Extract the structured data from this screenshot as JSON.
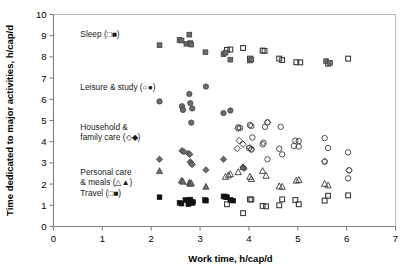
{
  "chart_data": {
    "type": "scatter",
    "title": "",
    "xlabel": "Work time, h/cap/d",
    "ylabel": "Time dedicated to major activities, h/cap/d",
    "xlim": [
      0,
      7
    ],
    "ylim": [
      0,
      10
    ],
    "xticks": [
      0,
      1,
      2,
      3,
      4,
      5,
      6,
      7
    ],
    "yticks": [
      0,
      1,
      2,
      3,
      4,
      5,
      6,
      7,
      8,
      9,
      10
    ],
    "grid": false,
    "legend_position": "inside-left-inline",
    "series": [
      {
        "name": "Sleep",
        "label": "Sleep (□■)",
        "label_x": 0.55,
        "label_y": 8.95,
        "marker_open": "square",
        "marker_filled": "square",
        "points_filled": [
          [
            2.17,
            8.55
          ],
          [
            2.58,
            8.8
          ],
          [
            2.62,
            8.77
          ],
          [
            2.72,
            8.62
          ],
          [
            2.78,
            9.05
          ],
          [
            2.8,
            8.65
          ],
          [
            2.82,
            8.58
          ],
          [
            3.11,
            8.22
          ],
          [
            3.48,
            8.13
          ],
          [
            3.52,
            8.2
          ],
          [
            3.62,
            7.87
          ],
          [
            4.02,
            7.83
          ],
          [
            4.05,
            7.88
          ],
          [
            5.58,
            7.8
          ],
          [
            5.66,
            7.72
          ]
        ],
        "points_open": [
          [
            3.55,
            8.33
          ],
          [
            3.88,
            8.42
          ],
          [
            3.62,
            8.35
          ],
          [
            4.02,
            7.92
          ],
          [
            4.28,
            8.3
          ],
          [
            4.32,
            8.28
          ],
          [
            4.62,
            7.92
          ],
          [
            4.68,
            7.85
          ],
          [
            4.97,
            7.75
          ],
          [
            5.05,
            7.74
          ],
          [
            5.62,
            7.68
          ],
          [
            6.03,
            7.92
          ]
        ]
      },
      {
        "name": "Leisure & study",
        "label": "Leisure & study (○●)",
        "label_x": 0.55,
        "label_y": 6.45,
        "marker_open": "circle",
        "marker_filled": "circle",
        "points_filled": [
          [
            2.17,
            5.9
          ],
          [
            2.63,
            5.67
          ],
          [
            2.65,
            5.5
          ],
          [
            2.78,
            6.25
          ],
          [
            2.8,
            5.82
          ],
          [
            2.84,
            5.57
          ],
          [
            2.82,
            4.9
          ],
          [
            3.12,
            6.6
          ],
          [
            3.48,
            5.35
          ],
          [
            3.62,
            5.47
          ]
        ],
        "points_open": [
          [
            3.78,
            4.68
          ],
          [
            3.82,
            4.65
          ],
          [
            4.02,
            4.78
          ],
          [
            4.05,
            4.74
          ],
          [
            4.07,
            4.2
          ],
          [
            4.38,
            4.92
          ],
          [
            4.33,
            4.7
          ],
          [
            4.65,
            4.7
          ],
          [
            4.28,
            3.87
          ],
          [
            4.3,
            3.95
          ],
          [
            4.0,
            3.7
          ],
          [
            4.05,
            3.63
          ],
          [
            4.38,
            3.17
          ],
          [
            4.62,
            3.67
          ],
          [
            4.68,
            3.4
          ],
          [
            4.95,
            4.05
          ],
          [
            5.02,
            4.03
          ],
          [
            4.92,
            3.8
          ],
          [
            5.02,
            3.77
          ],
          [
            5.55,
            4.17
          ],
          [
            5.55,
            3.05
          ],
          [
            5.62,
            3.7
          ],
          [
            6.03,
            3.5
          ],
          [
            6.05,
            2.65
          ],
          [
            6.03,
            2.27
          ]
        ]
      },
      {
        "name": "Household & family care",
        "label": "Household &\nfamily care (◇◆)",
        "label_x": 0.55,
        "label_y": 4.55,
        "marker_open": "diamond",
        "marker_filled": "diamond",
        "points_filled": [
          [
            2.17,
            3.17
          ],
          [
            2.63,
            3.57
          ],
          [
            2.67,
            3.53
          ],
          [
            2.76,
            3.45
          ],
          [
            2.79,
            3.4
          ],
          [
            2.8,
            3.05
          ],
          [
            2.82,
            2.97
          ],
          [
            2.84,
            2.92
          ],
          [
            3.12,
            2.67
          ],
          [
            3.48,
            3.17
          ],
          [
            3.88,
            2.8
          ],
          [
            3.9,
            2.75
          ]
        ],
        "points_open": [
          [
            3.78,
            4.62
          ],
          [
            3.8,
            4.05
          ],
          [
            3.76,
            3.68
          ],
          [
            3.88,
            3.88
          ],
          [
            4.02,
            3.72
          ],
          [
            4.05,
            3.65
          ],
          [
            4.38,
            4.9
          ],
          [
            5.55,
            3.08
          ],
          [
            6.05,
            2.65
          ]
        ]
      },
      {
        "name": "Personal care & meals",
        "label": "Personal care\n& meals (△▲)",
        "label_x": 0.55,
        "label_y": 2.45,
        "marker_open": "triangle",
        "marker_filled": "triangle",
        "points_filled": [
          [
            2.17,
            2.62
          ],
          [
            2.62,
            2.17
          ],
          [
            2.65,
            2.12
          ],
          [
            2.78,
            2.07
          ],
          [
            2.8,
            2.02
          ],
          [
            2.82,
            2.05
          ],
          [
            3.12,
            1.88
          ],
          [
            3.88,
            2.8
          ]
        ],
        "points_open": [
          [
            3.52,
            2.35
          ],
          [
            3.58,
            2.42
          ],
          [
            3.62,
            2.47
          ],
          [
            3.78,
            2.57
          ],
          [
            4.02,
            2.35
          ],
          [
            4.05,
            2.25
          ],
          [
            4.28,
            2.62
          ],
          [
            4.35,
            2.4
          ],
          [
            4.62,
            1.9
          ],
          [
            4.68,
            1.88
          ],
          [
            4.97,
            2.17
          ],
          [
            5.02,
            2.2
          ],
          [
            5.55,
            2.02
          ],
          [
            5.62,
            1.95
          ]
        ]
      },
      {
        "name": "Travel",
        "label": "Travel (□■)",
        "label_x": 0.55,
        "label_y": 1.45,
        "marker_open": "square",
        "marker_filled": "square",
        "points_filled": [
          [
            2.17,
            1.38
          ],
          [
            2.58,
            1.12
          ],
          [
            2.62,
            1.08
          ],
          [
            2.7,
            1.25
          ],
          [
            2.76,
            1.05
          ],
          [
            2.78,
            1.22
          ],
          [
            2.8,
            1.27
          ],
          [
            2.82,
            1.18
          ],
          [
            2.84,
            1.1
          ],
          [
            2.86,
            1.15
          ],
          [
            3.1,
            1.25
          ],
          [
            3.12,
            1.22
          ],
          [
            3.48,
            1.42
          ],
          [
            3.55,
            1.38
          ],
          [
            3.62,
            1.25
          ],
          [
            3.68,
            1.22
          ]
        ],
        "points_open": [
          [
            3.52,
            1.4
          ],
          [
            3.55,
            1.05
          ],
          [
            3.88,
            0.63
          ],
          [
            4.02,
            1.28
          ],
          [
            4.05,
            1.27
          ],
          [
            4.28,
            0.97
          ],
          [
            4.35,
            0.95
          ],
          [
            4.62,
            1.0
          ],
          [
            4.68,
            1.28
          ],
          [
            4.95,
            1.25
          ],
          [
            5.02,
            1.05
          ],
          [
            5.55,
            1.22
          ],
          [
            5.62,
            1.45
          ],
          [
            6.03,
            1.47
          ]
        ]
      }
    ]
  },
  "axes": {
    "x_title": "Work time, h/cap/d",
    "y_title": "Time dedicated to major activities, h/cap/d",
    "x_tick_labels": [
      "0",
      "1",
      "2",
      "3",
      "4",
      "5",
      "6",
      "7"
    ],
    "y_tick_labels": [
      "0",
      "1",
      "2",
      "3",
      "4",
      "5",
      "6",
      "7",
      "8",
      "9",
      "10"
    ]
  },
  "colors": {
    "axis": "#808080",
    "border": "#bdbdbd",
    "marker_filled": "#6b6b6b",
    "marker_open": "#4d4d4d",
    "marker_solid": "#111111",
    "text": "#000000"
  }
}
